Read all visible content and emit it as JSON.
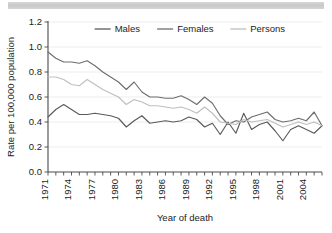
{
  "figure": {
    "background_color": "#ffffff",
    "scan_bar_color": "#cfcfcf"
  },
  "chart_data": {
    "type": "line",
    "title": "",
    "xlabel": "Year of death",
    "ylabel": "Rate per 100,000 population",
    "xlim": [
      1971,
      2006
    ],
    "ylim": [
      0.0,
      1.2
    ],
    "grid": true,
    "grid_axis": "y",
    "legend_position": "top-center",
    "y_ticks": [
      "0.0",
      "0.2",
      "0.4",
      "0.6",
      "0.8",
      "1.0",
      "1.2"
    ],
    "y_tick_values": [
      0.0,
      0.2,
      0.4,
      0.6,
      0.8,
      1.0,
      1.2
    ],
    "x_tick_labels": [
      "1971",
      "1974",
      "1977",
      "1980",
      "1983",
      "1986",
      "1989",
      "1992",
      "1995",
      "1998",
      "2001",
      "2004"
    ],
    "x_tick_values": [
      1971,
      1974,
      1977,
      1980,
      1983,
      1986,
      1989,
      1992,
      1995,
      1998,
      2001,
      2004
    ],
    "x": [
      1971,
      1972,
      1973,
      1974,
      1975,
      1976,
      1977,
      1978,
      1979,
      1980,
      1981,
      1982,
      1983,
      1984,
      1985,
      1986,
      1987,
      1988,
      1989,
      1990,
      1991,
      1992,
      1993,
      1994,
      1995,
      1996,
      1997,
      1998,
      1999,
      2000,
      2001,
      2002,
      2003,
      2004,
      2005,
      2006
    ],
    "series": [
      {
        "name": "Males",
        "color": "#5a5a5a",
        "values": [
          0.44,
          0.5,
          0.54,
          0.5,
          0.46,
          0.46,
          0.47,
          0.46,
          0.45,
          0.43,
          0.36,
          0.41,
          0.45,
          0.39,
          0.4,
          0.41,
          0.4,
          0.41,
          0.44,
          0.42,
          0.36,
          0.39,
          0.3,
          0.4,
          0.31,
          0.47,
          0.34,
          0.38,
          0.4,
          0.33,
          0.25,
          0.34,
          0.37,
          0.34,
          0.31,
          0.37
        ]
      },
      {
        "name": "Females",
        "color": "#6e6e6e",
        "values": [
          0.96,
          0.91,
          0.88,
          0.88,
          0.87,
          0.89,
          0.85,
          0.8,
          0.76,
          0.72,
          0.66,
          0.72,
          0.64,
          0.6,
          0.6,
          0.59,
          0.59,
          0.61,
          0.58,
          0.54,
          0.6,
          0.55,
          0.45,
          0.38,
          0.41,
          0.4,
          0.44,
          0.46,
          0.48,
          0.42,
          0.4,
          0.41,
          0.43,
          0.41,
          0.48,
          0.37
        ]
      },
      {
        "name": "Persons",
        "color": "#bfbfbf",
        "values": [
          0.76,
          0.76,
          0.74,
          0.7,
          0.69,
          0.74,
          0.7,
          0.66,
          0.63,
          0.6,
          0.54,
          0.58,
          0.56,
          0.53,
          0.53,
          0.52,
          0.51,
          0.52,
          0.5,
          0.47,
          0.52,
          0.47,
          0.4,
          0.39,
          0.38,
          0.42,
          0.4,
          0.41,
          0.42,
          0.39,
          0.36,
          0.38,
          0.4,
          0.38,
          0.4,
          0.37
        ]
      }
    ]
  }
}
